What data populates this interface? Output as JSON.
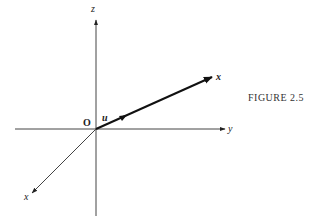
{
  "figure": {
    "caption": "FIGURE 2.5",
    "labels": {
      "z_axis": "z",
      "y_axis": "y",
      "x_axis": "x",
      "vector": "x",
      "unit_vector": "u",
      "origin": "O"
    },
    "colors": {
      "line": "#333333",
      "background": "#ffffff"
    }
  }
}
